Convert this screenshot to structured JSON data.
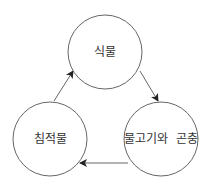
{
  "diagram": {
    "type": "cycle",
    "colors": {
      "stroke": "#666666",
      "text": "#333333",
      "background": "#ffffff"
    },
    "nodes": [
      {
        "id": "plants",
        "label": "식물",
        "cx": 105,
        "cy": 52,
        "r": 37
      },
      {
        "id": "sediment",
        "label": "침적물",
        "cx": 50,
        "cy": 139,
        "r": 37
      },
      {
        "id": "fish-insects",
        "label": "물고기와  곤충",
        "cx": 161,
        "cy": 139,
        "r": 37
      }
    ],
    "edges": [
      {
        "from": "sediment",
        "to": "plants"
      },
      {
        "from": "plants",
        "to": "fish-insects"
      },
      {
        "from": "fish-insects",
        "to": "sediment"
      }
    ]
  }
}
